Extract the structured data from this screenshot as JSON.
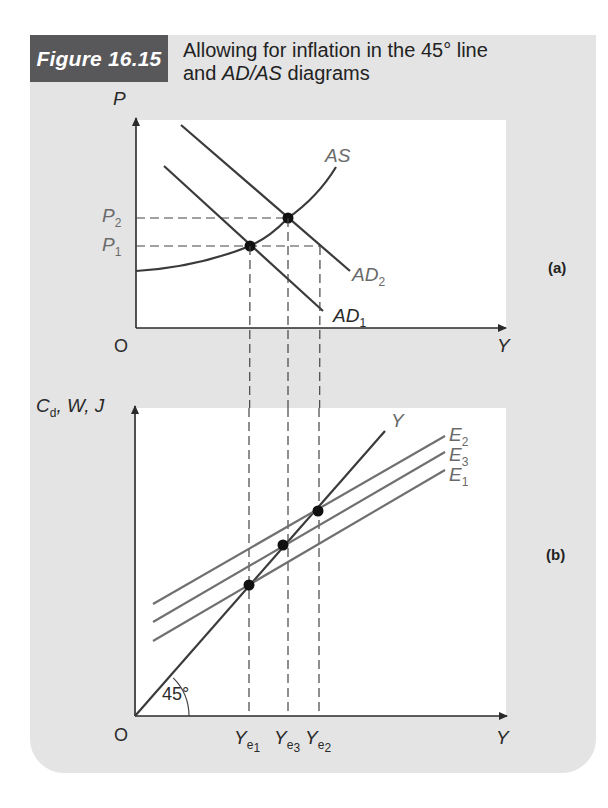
{
  "figure": {
    "label": "Figure 16.15",
    "title_line1": "Allowing for inflation in the 45° line",
    "title_line2_prefix": "and ",
    "title_line2_italic": "AD/AS",
    "title_line2_suffix": " diagrams",
    "colors": {
      "frame": "#e4e4e4",
      "label_bg": "#58585a",
      "panel_bg": "#ffffff"
    }
  },
  "chart_data": [
    {
      "type": "line",
      "panel": "(a)",
      "xlabel": "Y",
      "ylabel": "P",
      "origin_label": "O",
      "price_levels": [
        {
          "name": "P2",
          "main": "P",
          "sub": "2",
          "y_px": 218
        },
        {
          "name": "P1",
          "main": "P",
          "sub": "1",
          "y_px": 246
        }
      ],
      "series": [
        {
          "name": "AS",
          "main": "AS",
          "sub": "",
          "shape": "upward-sloping convex curve",
          "path": "M136,271 C185,268 220,258 250,246 C272,236 282,224 288,218 C305,206 322,190 336,167"
        },
        {
          "name": "AD1",
          "main": "AD",
          "sub": "1",
          "points": [
            [
              164,
              166
            ],
            [
              323,
              311
            ]
          ]
        },
        {
          "name": "AD2",
          "main": "AD",
          "sub": "2",
          "points": [
            [
              181,
              125
            ],
            [
              350,
              271
            ]
          ]
        }
      ],
      "equilibria": [
        {
          "name": "P1 at Ye1",
          "x": 250,
          "y": 246
        },
        {
          "name": "P2 at Ye3",
          "x": 288,
          "y": 218
        }
      ]
    },
    {
      "type": "line",
      "panel": "(b)",
      "xlabel": "Y",
      "ylabel": "Cd, W, J",
      "ylabel_parts": {
        "c": "C",
        "c_sub": "d",
        "rest": ", W, J"
      },
      "origin_label": "O",
      "angle_label": "45°",
      "series": [
        {
          "name": "Y (45° line)",
          "main": "Y",
          "sub": "",
          "points": [
            [
              135,
              716
            ],
            [
              385,
              431
            ]
          ]
        },
        {
          "name": "E2",
          "main": "E",
          "sub": "2",
          "points": [
            [
              153,
              604
            ],
            [
              445,
              436
            ]
          ]
        },
        {
          "name": "E3",
          "main": "E",
          "sub": "3",
          "points": [
            [
              153,
              622
            ],
            [
              445,
              452
            ]
          ]
        },
        {
          "name": "E1",
          "main": "E",
          "sub": "1",
          "points": [
            [
              153,
              641
            ],
            [
              445,
              470
            ]
          ]
        }
      ],
      "x_ticks": [
        {
          "name": "Ye1",
          "main": "Y",
          "sub": "e",
          "subsub": "1",
          "x_px": 249
        },
        {
          "name": "Ye3",
          "main": "Y",
          "sub": "e",
          "subsub": "3",
          "x_px": 288
        },
        {
          "name": "Ye2",
          "main": "Y",
          "sub": "e",
          "subsub": "2",
          "x_px": 319
        }
      ],
      "equilibria": [
        {
          "name": "E1 ∩ Y at Ye1",
          "x": 249,
          "y": 585
        },
        {
          "name": "E3 ∩ Y at Ye3",
          "x": 283,
          "y": 545
        },
        {
          "name": "E2 ∩ Y at Ye2",
          "x": 318,
          "y": 511
        }
      ]
    }
  ],
  "labels": {
    "panel_a": "(a)",
    "panel_b": "(b)",
    "P": "P",
    "Y": "Y",
    "O": "O",
    "AS": "AS",
    "AD": "AD",
    "E": "E",
    "sub1": "1",
    "sub2": "2",
    "sub3": "3",
    "sub_e": "e",
    "cd_c": "C",
    "cd_d": "d",
    "cd_rest": ", W, J",
    "angle": "45°"
  }
}
